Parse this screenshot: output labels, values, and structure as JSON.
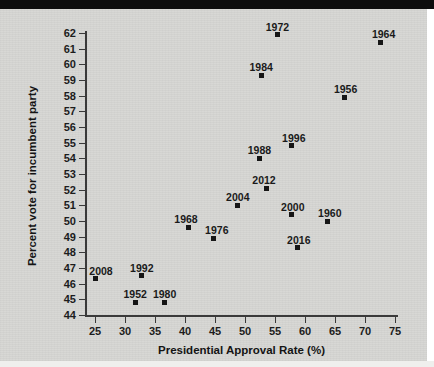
{
  "chart_data": {
    "type": "scatter",
    "title": "",
    "xlabel": "Presidential Approval Rate (%)",
    "ylabel": "Percent vote for incumbent party",
    "xlim": [
      23,
      76
    ],
    "ylim": [
      43.5,
      62.5
    ],
    "xticks": [
      25,
      30,
      35,
      40,
      45,
      50,
      55,
      60,
      65,
      70,
      75
    ],
    "yticks": [
      44,
      45,
      46,
      47,
      48,
      49,
      50,
      51,
      52,
      53,
      54,
      55,
      56,
      57,
      58,
      59,
      60,
      61,
      62
    ],
    "grid": false,
    "legend": null,
    "marker": "square",
    "marker_color": "#161616",
    "background_color": "#d6d6d3",
    "points": [
      {
        "label": "2008",
        "x": 25.0,
        "y": 46.3,
        "label_dx": 6,
        "label_dy": -13
      },
      {
        "label": "1992",
        "x": 32.8,
        "y": 46.5,
        "label_dx": 0,
        "label_dy": -13
      },
      {
        "label": "1952",
        "x": 31.7,
        "y": 44.8,
        "label_dx": 0,
        "label_dy": -13
      },
      {
        "label": "1980",
        "x": 36.6,
        "y": 44.8,
        "label_dx": 0,
        "label_dy": -13
      },
      {
        "label": "1968",
        "x": 40.5,
        "y": 49.6,
        "label_dx": -2,
        "label_dy": -13
      },
      {
        "label": "1976",
        "x": 44.8,
        "y": 48.9,
        "label_dx": 3,
        "label_dy": -13
      },
      {
        "label": "2004",
        "x": 48.8,
        "y": 51.0,
        "label_dx": 0,
        "label_dy": -13
      },
      {
        "label": "2012",
        "x": 53.5,
        "y": 52.1,
        "label_dx": -2,
        "label_dy": -13
      },
      {
        "label": "1988",
        "x": 52.4,
        "y": 54.0,
        "label_dx": 0,
        "label_dy": -13
      },
      {
        "label": "1996",
        "x": 57.8,
        "y": 54.8,
        "label_dx": 2,
        "label_dy": -13
      },
      {
        "label": "2000",
        "x": 57.8,
        "y": 50.4,
        "label_dx": 1,
        "label_dy": -13
      },
      {
        "label": "2016",
        "x": 58.8,
        "y": 48.3,
        "label_dx": 1,
        "label_dy": -13
      },
      {
        "label": "1960",
        "x": 63.8,
        "y": 50.0,
        "label_dx": 2,
        "label_dy": -13
      },
      {
        "label": "1984",
        "x": 52.7,
        "y": 59.3,
        "label_dx": 0,
        "label_dy": -13
      },
      {
        "label": "1972",
        "x": 55.4,
        "y": 61.9,
        "label_dx": 0,
        "label_dy": -13
      },
      {
        "label": "1956",
        "x": 66.6,
        "y": 57.9,
        "label_dx": 1,
        "label_dy": -13
      },
      {
        "label": "1964",
        "x": 72.6,
        "y": 61.4,
        "label_dx": 3,
        "label_dy": -13
      }
    ]
  }
}
